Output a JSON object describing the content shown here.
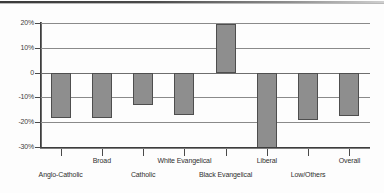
{
  "chart_data": {
    "type": "bar",
    "title": "",
    "subtitle": "",
    "xlabel": "",
    "ylabel": "",
    "categories": [
      "Anglo-Catholic",
      "Broad",
      "Catholic",
      "White Evangelical",
      "Black Evangelical",
      "Liberal",
      "Low/Others",
      "Overall"
    ],
    "values": [
      -18.5,
      -18.5,
      -13.0,
      -17.0,
      19.5,
      -30.5,
      -19.0,
      -17.5
    ],
    "value_labels": [
      "-18.5%",
      "-18.5%",
      "-13%",
      "-17%",
      "19.5%",
      "-30.5%",
      "-19%",
      "-17.5%"
    ],
    "ylim": [
      -30,
      20
    ],
    "yticks": [
      20,
      10,
      0,
      -10,
      -20,
      -30
    ],
    "ytick_labels": [
      "20%",
      "10%",
      "0",
      "-10%",
      "-20%",
      "-30%"
    ],
    "grid": true,
    "legend": "none",
    "bar_color": "#8e8e8e",
    "bar_border_color": "#4e4e4e",
    "axis_color": "#3d3d3d",
    "gridline_color": "#8a8a8a"
  }
}
